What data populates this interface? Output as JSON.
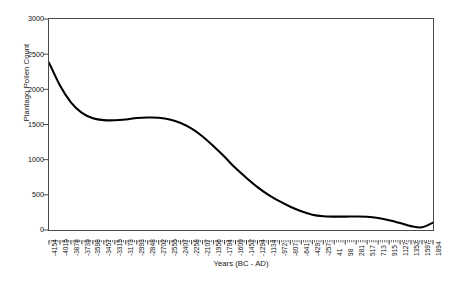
{
  "chart_data": {
    "type": "line",
    "title": "",
    "xlabel": "Years (BC - AD)",
    "ylabel": "Plantago Pollen Count",
    "ylim": [
      0,
      3000
    ],
    "ytick_labels": [
      "3000",
      "2500",
      "2000",
      "1500",
      "1000",
      "500",
      "0"
    ],
    "ytick_values": [
      3000,
      2500,
      2000,
      1500,
      1000,
      500,
      0
    ],
    "grid": false,
    "legend": null,
    "line_color": "#000000",
    "frame_color": "#4a4a4a",
    "categories": [
      "-4154",
      "-4015",
      "-3878",
      "-3739",
      "-3598",
      "-3457",
      "-3315",
      "-3173",
      "-2993",
      "-2848",
      "-2702",
      "-2555",
      "-2407",
      "-2258",
      "-2107",
      "-1956",
      "-1794",
      "-1609",
      "-1452",
      "-1294",
      "-1134",
      "-972",
      "-807",
      "-641",
      "-429",
      "-257",
      "41",
      "98",
      "281",
      "517",
      "713",
      "915",
      "1127",
      "1352",
      "1597",
      "1894"
    ],
    "values": [
      2380,
      2055,
      1815,
      1665,
      1590,
      1562,
      1560,
      1572,
      1592,
      1600,
      1596,
      1572,
      1520,
      1440,
      1330,
      1190,
      1040,
      880,
      740,
      610,
      500,
      410,
      330,
      265,
      218,
      196,
      190,
      190,
      192,
      188,
      170,
      140,
      100,
      55,
      38,
      105
    ],
    "series": [
      {
        "name": "Plantago Pollen Count",
        "values": [
          2380,
          2055,
          1815,
          1665,
          1590,
          1562,
          1560,
          1572,
          1592,
          1600,
          1596,
          1572,
          1520,
          1440,
          1330,
          1190,
          1040,
          880,
          740,
          610,
          500,
          410,
          330,
          265,
          218,
          196,
          190,
          190,
          192,
          188,
          170,
          140,
          100,
          55,
          38,
          105
        ]
      }
    ],
    "minor_ticks_per_interval": 4
  }
}
